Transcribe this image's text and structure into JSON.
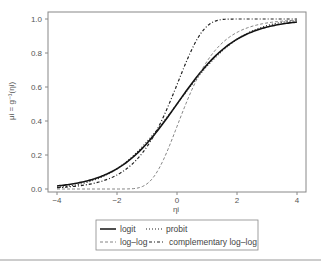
{
  "chart_data": {
    "type": "line",
    "title": "",
    "xlabel": "ηi",
    "ylabel": "μi = g⁻¹(ηi)",
    "xlim": [
      -4,
      4
    ],
    "ylim": [
      0,
      1
    ],
    "xticks": [
      "-4",
      "-2",
      "0",
      "2",
      "4"
    ],
    "yticks": [
      "0.0",
      "0.2",
      "0.4",
      "0.6",
      "0.8",
      "1.0"
    ],
    "grid": false,
    "legend_position": "bottom",
    "x": [
      -4,
      -3,
      -2,
      -1,
      0,
      1,
      2,
      3,
      4
    ],
    "series": [
      {
        "name": "logit",
        "style": "solid",
        "values": [
          0.02,
          0.05,
          0.12,
          0.27,
          0.5,
          0.73,
          0.88,
          0.95,
          0.98
        ]
      },
      {
        "name": "probit",
        "style": "dotted",
        "values": [
          0.0,
          0.03,
          0.12,
          0.28,
          0.5,
          0.72,
          0.89,
          0.97,
          1.0
        ]
      },
      {
        "name": "log–log",
        "style": "dashed",
        "values": [
          0.0,
          0.0,
          0.01,
          0.09,
          0.37,
          0.69,
          0.87,
          0.95,
          0.98
        ]
      },
      {
        "name": "complementary log–log",
        "style": "dash-dot",
        "values": [
          0.02,
          0.05,
          0.13,
          0.31,
          0.63,
          0.93,
          1.0,
          1.0,
          1.0
        ]
      }
    ]
  },
  "legend": {
    "items": [
      {
        "label": "logit",
        "style": "solid"
      },
      {
        "label": "probit",
        "style": "dotted"
      },
      {
        "label": "log–log",
        "style": "dashed"
      },
      {
        "label": "complementary log–log",
        "style": "dash-dot"
      }
    ]
  }
}
